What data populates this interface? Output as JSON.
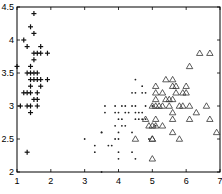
{
  "chart_data": {
    "type": "scatter",
    "title": "",
    "xlabel": "",
    "ylabel": "",
    "xlim": [
      1,
      7
    ],
    "ylim": [
      2,
      4.5
    ],
    "grid": false,
    "legend": null,
    "x_ticks": [
      "1",
      "2",
      "3",
      "4",
      "5",
      "6",
      "7"
    ],
    "y_ticks": [
      "2",
      "2.5",
      "3",
      "3.5",
      "4",
      "4.5"
    ],
    "series": [
      {
        "name": "plus",
        "marker": "+",
        "points": [
          [
            1.5,
            4.4
          ],
          [
            1.4,
            4.2
          ],
          [
            1.5,
            4.1
          ],
          [
            1.2,
            4.0
          ],
          [
            1.3,
            3.9
          ],
          [
            1.7,
            3.9
          ],
          [
            1.5,
            3.8
          ],
          [
            1.6,
            3.8
          ],
          [
            1.7,
            3.8
          ],
          [
            1.9,
            3.8
          ],
          [
            1.5,
            3.7
          ],
          [
            1.4,
            3.6
          ],
          [
            1.0,
            3.6
          ],
          [
            1.3,
            3.5
          ],
          [
            1.4,
            3.5
          ],
          [
            1.5,
            3.5
          ],
          [
            1.6,
            3.5
          ],
          [
            1.4,
            3.4
          ],
          [
            1.5,
            3.4
          ],
          [
            1.6,
            3.4
          ],
          [
            1.7,
            3.4
          ],
          [
            1.9,
            3.4
          ],
          [
            1.4,
            3.3
          ],
          [
            1.7,
            3.3
          ],
          [
            1.2,
            3.2
          ],
          [
            1.3,
            3.2
          ],
          [
            1.4,
            3.2
          ],
          [
            1.6,
            3.2
          ],
          [
            1.5,
            3.1
          ],
          [
            1.6,
            3.1
          ],
          [
            1.1,
            3.0
          ],
          [
            1.3,
            3.0
          ],
          [
            1.4,
            3.0
          ],
          [
            1.6,
            3.0
          ],
          [
            1.4,
            2.9
          ],
          [
            1.3,
            2.3
          ]
        ]
      },
      {
        "name": "dot",
        "marker": ".",
        "points": [
          [
            4.5,
            3.4
          ],
          [
            4.7,
            3.3
          ],
          [
            4.4,
            3.2
          ],
          [
            4.5,
            3.2
          ],
          [
            4.7,
            3.2
          ],
          [
            4.8,
            3.2
          ],
          [
            3.6,
            3.0
          ],
          [
            3.9,
            3.0
          ],
          [
            4.1,
            3.0
          ],
          [
            4.2,
            3.0
          ],
          [
            4.4,
            3.0
          ],
          [
            4.5,
            3.0
          ],
          [
            4.8,
            3.0
          ],
          [
            5.0,
            3.0
          ],
          [
            3.9,
            2.9
          ],
          [
            4.0,
            2.9
          ],
          [
            4.3,
            2.9
          ],
          [
            4.5,
            2.9
          ],
          [
            4.6,
            2.9
          ],
          [
            4.7,
            2.9
          ],
          [
            3.5,
            2.6
          ],
          [
            4.2,
            2.9
          ],
          [
            3.6,
            2.9
          ],
          [
            4.0,
            2.8
          ],
          [
            4.1,
            2.8
          ],
          [
            4.5,
            2.8
          ],
          [
            4.6,
            2.8
          ],
          [
            4.7,
            2.8
          ],
          [
            4.8,
            2.8
          ],
          [
            3.9,
            2.7
          ],
          [
            4.1,
            2.7
          ],
          [
            4.2,
            2.7
          ],
          [
            5.1,
            2.7
          ],
          [
            3.5,
            2.6
          ],
          [
            4.0,
            2.6
          ],
          [
            4.4,
            2.6
          ],
          [
            3.0,
            2.5
          ],
          [
            3.9,
            2.5
          ],
          [
            4.0,
            2.5
          ],
          [
            4.9,
            2.5
          ],
          [
            3.3,
            2.4
          ],
          [
            3.7,
            2.4
          ],
          [
            3.8,
            2.4
          ],
          [
            3.3,
            2.3
          ],
          [
            4.0,
            2.3
          ],
          [
            4.4,
            2.3
          ],
          [
            4.0,
            2.2
          ],
          [
            4.5,
            2.2
          ],
          [
            3.5,
            2.0
          ]
        ]
      },
      {
        "name": "triangle",
        "marker": "^",
        "points": [
          [
            6.4,
            3.8
          ],
          [
            6.7,
            3.8
          ],
          [
            6.1,
            3.6
          ],
          [
            5.6,
            3.4
          ],
          [
            5.4,
            3.4
          ],
          [
            5.7,
            3.3
          ],
          [
            6.0,
            3.3
          ],
          [
            5.1,
            3.3
          ],
          [
            5.6,
            3.3
          ],
          [
            5.1,
            3.2
          ],
          [
            5.3,
            3.2
          ],
          [
            5.7,
            3.2
          ],
          [
            5.9,
            3.2
          ],
          [
            6.0,
            3.2
          ],
          [
            5.4,
            3.1
          ],
          [
            5.5,
            3.1
          ],
          [
            5.6,
            3.1
          ],
          [
            5.1,
            3.1
          ],
          [
            5.1,
            3.0
          ],
          [
            5.2,
            3.0
          ],
          [
            5.3,
            3.0
          ],
          [
            5.5,
            3.0
          ],
          [
            5.8,
            3.0
          ],
          [
            6.1,
            3.0
          ],
          [
            6.6,
            3.0
          ],
          [
            5.0,
            3.0
          ],
          [
            5.9,
            3.0
          ],
          [
            5.6,
            2.9
          ],
          [
            6.3,
            2.9
          ],
          [
            5.6,
            2.8
          ],
          [
            6.1,
            2.8
          ],
          [
            6.7,
            2.8
          ],
          [
            4.8,
            2.8
          ],
          [
            5.1,
            2.8
          ],
          [
            5.1,
            2.7
          ],
          [
            5.3,
            2.7
          ],
          [
            5.0,
            2.7
          ],
          [
            4.9,
            2.7
          ],
          [
            6.9,
            2.6
          ],
          [
            5.6,
            2.6
          ],
          [
            5.0,
            2.5
          ],
          [
            5.8,
            2.5
          ],
          [
            5.0,
            2.5
          ],
          [
            4.5,
            2.5
          ],
          [
            5.0,
            2.2
          ]
        ]
      }
    ]
  }
}
